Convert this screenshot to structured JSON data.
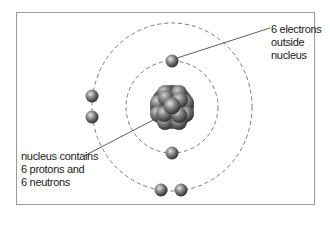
{
  "diagram": {
    "labels": {
      "electrons": {
        "lines": [
          "6 electrons",
          "outside",
          "nucleus"
        ]
      },
      "nucleus": {
        "lines": [
          "nucleus contains",
          "6 protons and",
          "6 neutrons"
        ]
      }
    },
    "nucleus": {
      "center": [
        172,
        107
      ],
      "particle_count": 12
    },
    "orbits": [
      {
        "name": "inner-shell",
        "rx": 46,
        "ry": 46,
        "electrons": 2
      },
      {
        "name": "outer-shell",
        "rx": 80,
        "ry": 84,
        "electrons": 4
      }
    ],
    "colors": {
      "frame": "#9a9a9a",
      "orbit": "#777777",
      "particle_dark": "#3a3a3a",
      "particle_light": "#d8d8d8",
      "text": "#1a1a1a"
    }
  }
}
